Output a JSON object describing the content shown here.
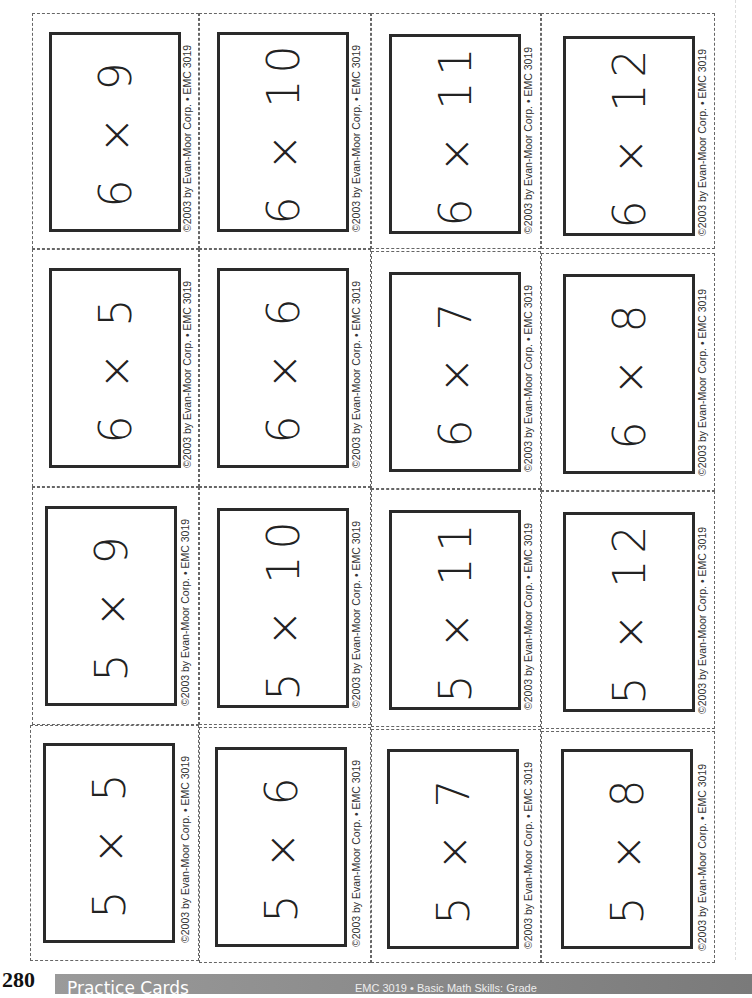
{
  "page": {
    "page_number": "280",
    "section_title": "Practice Cards",
    "footer_right": "EMC 3019 • Basic Math Skills: Grade"
  },
  "copyright": "©2003 by Evan-Moor Corp. • EMC 3019",
  "cards": [
    {
      "row": 0,
      "col": 0,
      "fact": "6 × 9"
    },
    {
      "row": 0,
      "col": 1,
      "fact": "6 × 10"
    },
    {
      "row": 0,
      "col": 2,
      "fact": "6 × 11"
    },
    {
      "row": 0,
      "col": 3,
      "fact": "6 × 12"
    },
    {
      "row": 1,
      "col": 0,
      "fact": "6 × 5"
    },
    {
      "row": 1,
      "col": 1,
      "fact": "6 × 6"
    },
    {
      "row": 1,
      "col": 2,
      "fact": "6 × 7"
    },
    {
      "row": 1,
      "col": 3,
      "fact": "6 × 8"
    },
    {
      "row": 2,
      "col": 0,
      "fact": "5 × 9"
    },
    {
      "row": 2,
      "col": 1,
      "fact": "5 × 10"
    },
    {
      "row": 2,
      "col": 2,
      "fact": "5 × 11"
    },
    {
      "row": 2,
      "col": 3,
      "fact": "5 × 12"
    },
    {
      "row": 3,
      "col": 0,
      "fact": "5 × 5"
    },
    {
      "row": 3,
      "col": 1,
      "fact": "5 × 6"
    },
    {
      "row": 3,
      "col": 2,
      "fact": "5 × 7"
    },
    {
      "row": 3,
      "col": 3,
      "fact": "5 × 8"
    }
  ]
}
